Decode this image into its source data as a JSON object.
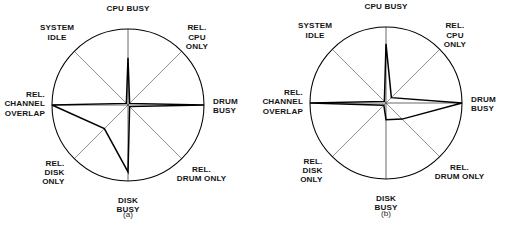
{
  "figure": {
    "type": "kiviat-star-chart-pair",
    "background_color": "#ffffff",
    "line_color": "#000000",
    "spoke_color": "#4d4d4d"
  },
  "axes": [
    {
      "key": "cpu_busy",
      "label_lines": [
        "CPU BUSY"
      ],
      "angle_deg": 90
    },
    {
      "key": "rel_cpu_only",
      "label_lines": [
        "REL.",
        "CPU",
        "ONLY"
      ],
      "angle_deg": 45
    },
    {
      "key": "drum_busy",
      "label_lines": [
        "DRUM",
        "BUSY"
      ],
      "angle_deg": 0
    },
    {
      "key": "rel_drum_only",
      "label_lines": [
        "REL.",
        "DRUM ONLY"
      ],
      "angle_deg": -45
    },
    {
      "key": "disk_busy",
      "label_lines": [
        "DISK",
        "BUSY"
      ],
      "angle_deg": -90
    },
    {
      "key": "rel_disk_only",
      "label_lines": [
        "REL.",
        "DISK",
        "ONLY"
      ],
      "angle_deg": -135
    },
    {
      "key": "rel_channel_overlap",
      "label_lines": [
        "REL.",
        "CHANNEL",
        "OVERLAP"
      ],
      "angle_deg": 180
    },
    {
      "key": "system_idle",
      "label_lines": [
        "SYSTEM",
        "IDLE"
      ],
      "angle_deg": 135
    }
  ],
  "chart_data": [
    {
      "type": "radar",
      "id": "a",
      "caption": "(a)",
      "title": "",
      "categories": [
        "CPU BUSY",
        "REL. CPU ONLY",
        "DRUM BUSY",
        "REL. DRUM ONLY",
        "DISK BUSY",
        "REL. DISK ONLY",
        "REL. CHANNEL OVERLAP",
        "SYSTEM IDLE"
      ],
      "values": [
        0.62,
        0.03,
        1.0,
        0.03,
        0.88,
        0.44,
        1.0,
        0.03
      ],
      "rlim": [
        0,
        1
      ],
      "grid": false,
      "legend": "none",
      "xlabel": "",
      "ylabel": ""
    },
    {
      "type": "radar",
      "id": "b",
      "caption": "(b)",
      "title": "",
      "categories": [
        "CPU BUSY",
        "REL. CPU ONLY",
        "DRUM BUSY",
        "REL. DRUM ONLY",
        "DISK BUSY",
        "REL. DISK ONLY",
        "REL. CHANNEL OVERLAP",
        "SYSTEM IDLE"
      ],
      "values": [
        0.78,
        0.1,
        1.0,
        0.3,
        0.22,
        0.04,
        1.0,
        0.03
      ],
      "rlim": [
        0,
        1
      ],
      "grid": false,
      "legend": "none",
      "xlabel": "",
      "ylabel": ""
    }
  ]
}
